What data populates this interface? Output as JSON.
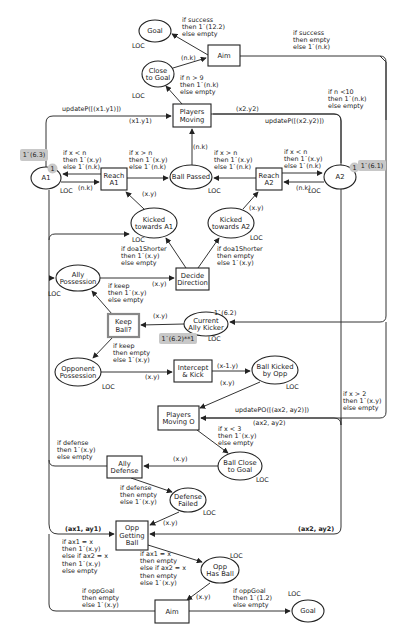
{
  "diagram": {
    "type": "colored-petri-net",
    "colors": {
      "stroke": "#333333",
      "marking_bg": "#c8c8c8",
      "background": "#ffffff"
    },
    "places": [
      {
        "id": "goal_top",
        "label": [
          "Goal"
        ],
        "cx": 155,
        "cy": 31,
        "rx": 16,
        "ry": 11,
        "colset": "LOC",
        "cs_x": 132,
        "cs_y": 48
      },
      {
        "id": "close_to_goal",
        "label": [
          "Close",
          "to Goal"
        ],
        "cx": 158,
        "cy": 74,
        "rx": 16,
        "ry": 13,
        "colset": "LOC",
        "cs_x": 132,
        "cs_y": 98
      },
      {
        "id": "a1",
        "label": [
          "A1"
        ],
        "cx": 46,
        "cy": 178,
        "rx": 15,
        "ry": 11,
        "colset": "LOC",
        "cs_x": 60,
        "cs_y": 193
      },
      {
        "id": "ball_passed",
        "label": [
          "Ball Passed"
        ],
        "cx": 191,
        "cy": 177,
        "rx": 21,
        "ry": 12,
        "colset": "LOC",
        "cs_x": 208,
        "cs_y": 193
      },
      {
        "id": "a2",
        "label": [
          "A2"
        ],
        "cx": 340,
        "cy": 177,
        "rx": 16,
        "ry": 12,
        "colset": "LOC",
        "cs_x": 308,
        "cs_y": 193
      },
      {
        "id": "kicked_a1",
        "label": [
          "Kicked",
          "towards A1"
        ],
        "cx": 154,
        "cy": 223,
        "rx": 23,
        "ry": 15,
        "colset": "LOC",
        "cs_x": 132,
        "cs_y": 242
      },
      {
        "id": "kicked_a2",
        "label": [
          "Kicked",
          "towards A2"
        ],
        "cx": 231,
        "cy": 223,
        "rx": 23,
        "ry": 15,
        "colset": "LOC",
        "cs_x": 250,
        "cs_y": 240
      },
      {
        "id": "ally_possession",
        "label": [
          "Ally",
          "Possession"
        ],
        "cx": 78,
        "cy": 278,
        "rx": 22,
        "ry": 13,
        "colset": "LOC",
        "cs_x": 48,
        "cs_y": 296
      },
      {
        "id": "current_ally_kicker",
        "label": [
          "Current",
          "Ally Kicker"
        ],
        "cx": 206,
        "cy": 324,
        "rx": 22,
        "ry": 12,
        "colset": "LOC",
        "cs_x": 208,
        "cs_y": 341
      },
      {
        "id": "opponent_possession",
        "label": [
          "Opponent",
          "Possession"
        ],
        "cx": 78,
        "cy": 372,
        "rx": 23,
        "ry": 14,
        "colset": "LOC",
        "cs_x": 102,
        "cs_y": 389
      },
      {
        "id": "ball_kicked_opp",
        "label": [
          "Ball Kicked",
          "by Opp"
        ],
        "cx": 275,
        "cy": 370,
        "rx": 23,
        "ry": 14,
        "colset": "LOC",
        "cs_x": 286,
        "cs_y": 389
      },
      {
        "id": "ball_close_goal",
        "label": [
          "Ball Close",
          "to Goal"
        ],
        "cx": 240,
        "cy": 466,
        "rx": 22,
        "ry": 14,
        "colset": "LOC",
        "cs_x": 256,
        "cs_y": 482
      },
      {
        "id": "defense_failed",
        "label": [
          "Defense",
          "Failed"
        ],
        "cx": 188,
        "cy": 500,
        "rx": 18,
        "ry": 12,
        "colset": "LOC",
        "cs_x": 203,
        "cs_y": 515
      },
      {
        "id": "opp_has_ball",
        "label": [
          "Opp",
          "Has Ball"
        ],
        "cx": 220,
        "cy": 570,
        "rx": 19,
        "ry": 13,
        "colset": "LOC",
        "cs_x": 230,
        "cs_y": 558
      },
      {
        "id": "goal_bottom",
        "label": [
          "Goal"
        ],
        "cx": 308,
        "cy": 611,
        "rx": 16,
        "ry": 11,
        "colset": "LOC",
        "cs_x": 288,
        "cs_y": 596
      }
    ],
    "transitions": [
      {
        "id": "aim_top",
        "label": [
          "Aim"
        ],
        "x": 208,
        "y": 45,
        "w": 32,
        "h": 21,
        "highlight": false
      },
      {
        "id": "players_moving",
        "label": [
          "Players",
          "Moving"
        ],
        "x": 173,
        "y": 104,
        "w": 38,
        "h": 23,
        "highlight": false
      },
      {
        "id": "reach_a1",
        "label": [
          "Reach",
          "A1"
        ],
        "x": 101,
        "y": 168,
        "w": 26,
        "h": 22,
        "highlight": false
      },
      {
        "id": "reach_a2",
        "label": [
          "Reach",
          "A2"
        ],
        "x": 256,
        "y": 168,
        "w": 26,
        "h": 22,
        "highlight": false
      },
      {
        "id": "decide_direction",
        "label": [
          "Decide",
          "Direction"
        ],
        "x": 176,
        "y": 268,
        "w": 33,
        "h": 22,
        "highlight": false
      },
      {
        "id": "keep_ball",
        "label": [
          "Keep",
          "Ball?"
        ],
        "x": 108,
        "y": 314,
        "w": 31,
        "h": 23,
        "highlight": true
      },
      {
        "id": "intercept_kick",
        "label": [
          "Intercept",
          "& Kick"
        ],
        "x": 174,
        "y": 360,
        "w": 38,
        "h": 22,
        "highlight": false
      },
      {
        "id": "players_moving_o",
        "label": [
          "Players",
          "Moving O"
        ],
        "x": 158,
        "y": 406,
        "w": 41,
        "h": 24,
        "highlight": false
      },
      {
        "id": "ally_defense",
        "label": [
          "Ally",
          "Defense"
        ],
        "x": 107,
        "y": 456,
        "w": 35,
        "h": 22,
        "highlight": false
      },
      {
        "id": "opp_getting_ball",
        "label": [
          "Opp",
          "Getting",
          "Ball"
        ],
        "x": 116,
        "y": 521,
        "w": 32,
        "h": 29,
        "highlight": false
      },
      {
        "id": "aim_bottom",
        "label": [
          "Aim"
        ],
        "x": 155,
        "y": 600,
        "w": 34,
        "h": 23,
        "highlight": false
      }
    ],
    "markings": [
      {
        "id": "a1_initial",
        "text": "1`(6.3)",
        "x": 20,
        "y": 149,
        "w": 28,
        "h": 12
      },
      {
        "id": "a1_count",
        "text": "1",
        "x": 48,
        "y": 164,
        "w": 9,
        "h": 9
      },
      {
        "id": "a2_count",
        "text": "1",
        "x": 350,
        "y": 163,
        "w": 9,
        "h": 9
      },
      {
        "id": "a2_initial",
        "text": "1`(6.1)",
        "x": 358,
        "y": 160,
        "w": 28,
        "h": 11
      },
      {
        "id": "kicker_current",
        "text": "1`(6.2)**1",
        "x": 159,
        "y": 333,
        "w": 38,
        "h": 11
      }
    ],
    "edge_labels": [
      {
        "lines": [
          "if success",
          "then 1`(12.2)",
          "else empty"
        ],
        "x": 182,
        "y": 22
      },
      {
        "lines": [
          "if success",
          "then empty",
          "else 1`(n.k)"
        ],
        "x": 293,
        "y": 35
      },
      {
        "lines": [
          "(n.k)"
        ],
        "x": 181,
        "y": 60
      },
      {
        "lines": [
          "if n > 9",
          "then 1`(n.k)",
          "else empty"
        ],
        "x": 180,
        "y": 80
      },
      {
        "lines": [
          "if n <10",
          "then 1`(n.k)",
          "else empty"
        ],
        "x": 328,
        "y": 94
      },
      {
        "lines": [
          "updateP([(x1.y1)])"
        ],
        "x": 62,
        "y": 111
      },
      {
        "lines": [
          "(x1.y1)"
        ],
        "x": 129,
        "y": 123
      },
      {
        "lines": [
          "(x2.y2)"
        ],
        "x": 236,
        "y": 111
      },
      {
        "lines": [
          "updateP([(x2.y2)])"
        ],
        "x": 265,
        "y": 123
      },
      {
        "lines": [
          "(n.k)"
        ],
        "x": 193,
        "y": 149
      },
      {
        "lines": [
          "if x < n",
          "then 1`(x.y)",
          "else 1`(n.k)"
        ],
        "x": 63,
        "y": 155
      },
      {
        "lines": [
          "if x > n",
          "then 1`(x.y)",
          "else 1`(n.k)"
        ],
        "x": 129,
        "y": 155
      },
      {
        "lines": [
          "if x > n",
          "then 1`(x.y)",
          "else 1`(n.k)"
        ],
        "x": 214,
        "y": 155
      },
      {
        "lines": [
          "if x < n",
          "then 1`(x.y)",
          "else 1`(n.k)"
        ],
        "x": 284,
        "y": 154
      },
      {
        "lines": [
          "(n.k)"
        ],
        "x": 78,
        "y": 190
      },
      {
        "lines": [
          "(n.k)"
        ],
        "x": 296,
        "y": 190
      },
      {
        "lines": [
          "(x.y)"
        ],
        "x": 142,
        "y": 196
      },
      {
        "lines": [
          "(x.y)"
        ],
        "x": 249,
        "y": 210
      },
      {
        "lines": [
          "if doa1Shorter",
          "then 1`(x.y)",
          "else empty"
        ],
        "x": 121,
        "y": 251
      },
      {
        "lines": [
          "if doa1Shorter",
          "then empty",
          "else 1`(x.y)"
        ],
        "x": 217,
        "y": 251
      },
      {
        "lines": [
          "(x.y)"
        ],
        "x": 152,
        "y": 286
      },
      {
        "lines": [
          "if keep",
          "then 1`(x.y)",
          "else empty"
        ],
        "x": 108,
        "y": 288
      },
      {
        "lines": [
          "(x.y)"
        ],
        "x": 153,
        "y": 318
      },
      {
        "lines": [
          "1`(6.2)"
        ],
        "x": 214,
        "y": 315
      },
      {
        "lines": [
          "if keep",
          "then empty",
          "else 1`(x.y)"
        ],
        "x": 113,
        "y": 348
      },
      {
        "lines": [
          "(x.y)"
        ],
        "x": 145,
        "y": 379
      },
      {
        "lines": [
          "(x-1.y)"
        ],
        "x": 217,
        "y": 368
      },
      {
        "lines": [
          "(x.y)"
        ],
        "x": 220,
        "y": 385
      },
      {
        "lines": [
          "if x > 2",
          "then 1`(x.y)",
          "else empty"
        ],
        "x": 343,
        "y": 396
      },
      {
        "lines": [
          "updatePO([(ax2, ay2)])"
        ],
        "x": 235,
        "y": 412
      },
      {
        "lines": [
          "(ax2, ay2)"
        ],
        "x": 253,
        "y": 425
      },
      {
        "lines": [
          "if x < 3",
          "then 1`(x.y)",
          "else empty"
        ],
        "x": 218,
        "y": 431
      },
      {
        "lines": [
          "if defense",
          "then 1`(x.y)",
          "else empty"
        ],
        "x": 57,
        "y": 445
      },
      {
        "lines": [
          "(x.y)"
        ],
        "x": 173,
        "y": 461
      },
      {
        "lines": [
          "if defense",
          "then empty",
          "else 1`(x.y)"
        ],
        "x": 120,
        "y": 490
      },
      {
        "lines": [
          "(x.y)"
        ],
        "x": 163,
        "y": 525
      },
      {
        "lines": [
          "(ax1, ay1)"
        ],
        "x": 65,
        "y": 531,
        "bold": true
      },
      {
        "lines": [
          "(ax2, ay2)"
        ],
        "x": 298,
        "y": 531,
        "bold": true
      },
      {
        "lines": [
          "if ax1 = x",
          "then 1`(x.y)",
          "else if ax2 = x",
          "then 1`(x.y)",
          "else empty"
        ],
        "x": 62,
        "y": 544
      },
      {
        "lines": [
          "if ax1 = x",
          "then empty",
          "else if ax2 = x",
          "then empty",
          "else 1`(x.y)"
        ],
        "x": 140,
        "y": 556
      },
      {
        "lines": [
          "if oppGoal",
          "then empty",
          "else 1`(x.y)"
        ],
        "x": 82,
        "y": 593
      },
      {
        "lines": [
          "(x.y)"
        ],
        "x": 196,
        "y": 599
      },
      {
        "lines": [
          "if oppGoal",
          "then 1`(1.2)",
          "else empty"
        ],
        "x": 233,
        "y": 593
      }
    ],
    "arcs": [
      {
        "d": "M208,55 L172,34",
        "arrow": "end"
      },
      {
        "d": "M173,68 L206,58",
        "arrow": "end"
      },
      {
        "d": "M182,104 L166,86",
        "arrow": "end"
      },
      {
        "d": "M240,56 L380,56 Q386,56 386,62 L386,316 Q386,322 380,322 L230,322",
        "arrow": "end"
      },
      {
        "d": "M380,56 L386,62 L386,120",
        "arrow": "none"
      },
      {
        "d": "M46,167 L46,123 Q46,116 53,116 L171,116",
        "arrow": "end"
      },
      {
        "d": "M341,165 L341,121 Q341,114 334,114 L213,114",
        "arrow": "none"
      },
      {
        "d": "M213,114 L213,114",
        "arrow": "none"
      },
      {
        "d": "M211,114 L334,114 Q341,114 341,121 L341,163",
        "arrow": "none"
      },
      {
        "d": "M192,165 L192,129",
        "arrow": "end"
      },
      {
        "d": "M101,174 L63,174",
        "arrow": "end"
      },
      {
        "d": "M61,182 L99,182",
        "arrow": "end"
      },
      {
        "d": "M127,178 L168,178",
        "arrow": "end"
      },
      {
        "d": "M256,178 L214,178",
        "arrow": "end"
      },
      {
        "d": "M282,173 L322,173",
        "arrow": "end"
      },
      {
        "d": "M324,182 L284,182",
        "arrow": "end"
      },
      {
        "d": "M144,209 L126,192",
        "arrow": "end"
      },
      {
        "d": "M243,209 L258,192",
        "arrow": "end"
      },
      {
        "d": "M186,268 L166,238",
        "arrow": "end"
      },
      {
        "d": "M198,268 L219,238",
        "arrow": "end"
      },
      {
        "d": "M100,278 L174,278",
        "arrow": "end"
      },
      {
        "d": "M184,324 L141,325",
        "arrow": "end"
      },
      {
        "d": "M112,314 L92,291",
        "arrow": "end"
      },
      {
        "d": "M113,337 L93,358",
        "arrow": "end"
      },
      {
        "d": "M101,372 L172,372",
        "arrow": "end"
      },
      {
        "d": "M212,371 L250,371",
        "arrow": "end"
      },
      {
        "d": "M260,382 L200,408",
        "arrow": "end"
      },
      {
        "d": "M341,189 L341,425 Q341,418 334,418 L201,418",
        "arrow": "none"
      },
      {
        "d": "M341,418 L201,418",
        "arrow": "end"
      },
      {
        "d": "M386,322 L386,412 Q386,418 380,418 L341,418",
        "arrow": "none"
      },
      {
        "d": "M197,430 L228,453",
        "arrow": "end"
      },
      {
        "d": "M218,466 L144,466",
        "arrow": "end"
      },
      {
        "d": "M107,466 L55,466 Q49,466 49,460",
        "arrow": "none"
      },
      {
        "d": "M131,478 L172,492",
        "arrow": "end"
      },
      {
        "d": "M179,512 L150,525",
        "arrow": "end"
      },
      {
        "d": "M49,190 L49,524 Q49,534 58,534 L114,534",
        "arrow": "end"
      },
      {
        "d": "M49,240 Q49,234 55,234 L129,234",
        "arrow": "end"
      },
      {
        "d": "M49,278 L54,278",
        "arrow": "end"
      },
      {
        "d": "M341,418 L341,527 Q341,534 334,534 L150,534",
        "arrow": "end"
      },
      {
        "d": "M148,545 L202,562",
        "arrow": "end"
      },
      {
        "d": "M210,583 L187,600",
        "arrow": "end"
      },
      {
        "d": "M155,611 L56,611 Q49,611 49,604 L49,534",
        "arrow": "none"
      },
      {
        "d": "M189,611 L290,611",
        "arrow": "end"
      }
    ]
  }
}
